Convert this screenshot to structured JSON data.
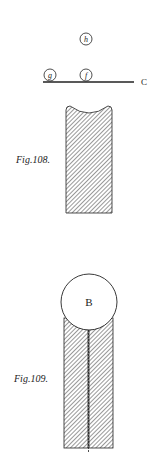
{
  "figures": [
    {
      "label": "Fig.108.",
      "points": [
        {
          "name": "h",
          "cx": 86,
          "cy": 39,
          "r": 6
        },
        {
          "name": "g",
          "cx": 50,
          "cy": 75,
          "r": 6
        },
        {
          "name": "f",
          "cx": 86,
          "cy": 75,
          "r": 6
        }
      ],
      "line_label": "C"
    },
    {
      "label": "Fig.109.",
      "ball_label": "B"
    }
  ],
  "colors": {
    "ink": "#222222",
    "paper": "#ffffff"
  }
}
